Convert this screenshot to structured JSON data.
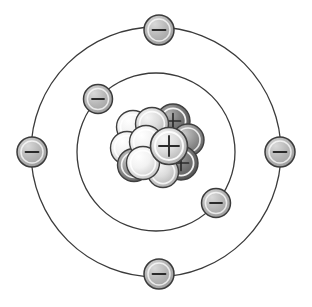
{
  "diagram": {
    "type": "atomic-structure",
    "background_color": "#ffffff",
    "center": {
      "x": 156,
      "y": 151
    },
    "line_color": "#3b3b3b",
    "nucleus": {
      "label": "nucleus",
      "proton_symbol": "+",
      "proton_count": 5,
      "neutron_count": 6,
      "particle_count": 11,
      "proton_color": "#8d8d8d",
      "proton_dark_color": "#6e6e6e",
      "neutron_color": "#d8d8d8",
      "neutron_light_color": "#efefef",
      "outline_color": "#3b3b3b",
      "particles": [
        {
          "id": "p1",
          "kind": "proton",
          "symbol": "+",
          "cx": 172,
          "cy": 122,
          "r": 16,
          "fill": "#767676",
          "z": 1
        },
        {
          "id": "n1",
          "kind": "neutron",
          "symbol": "",
          "cx": 133,
          "cy": 128,
          "r": 16,
          "fill": "#ececec",
          "z": 2
        },
        {
          "id": "n2",
          "kind": "neutron",
          "symbol": "",
          "cx": 152,
          "cy": 126,
          "r": 16,
          "fill": "#d4d4d4",
          "z": 3
        },
        {
          "id": "n3",
          "kind": "neutron",
          "symbol": "",
          "cx": 127,
          "cy": 148,
          "r": 16,
          "fill": "#cfcfcf",
          "z": 4
        },
        {
          "id": "p2",
          "kind": "proton",
          "symbol": "+",
          "cx": 183,
          "cy": 146,
          "r": 16,
          "fill": "#8a8a8a",
          "z": 5
        },
        {
          "id": "n4",
          "kind": "neutron",
          "symbol": "",
          "cx": 147,
          "cy": 168,
          "r": 16,
          "fill": "#bdbdbd",
          "z": 6
        },
        {
          "id": "p3",
          "kind": "proton",
          "symbol": "+",
          "cx": 131,
          "cy": 160,
          "r": 16,
          "fill": "#9b9b9b",
          "z": 7
        },
        {
          "id": "n5",
          "kind": "neutron",
          "symbol": "",
          "cx": 150,
          "cy": 147,
          "r": 17,
          "fill": "#e8e8e8",
          "z": 8
        },
        {
          "id": "p4",
          "kind": "proton",
          "symbol": "+",
          "cx": 178,
          "cy": 163,
          "r": 16,
          "fill": "#6f6f6f",
          "z": 9
        },
        {
          "id": "n6",
          "kind": "neutron",
          "symbol": "",
          "cx": 163,
          "cy": 170,
          "r": 15,
          "fill": "#c8c8c8",
          "z": 10
        },
        {
          "id": "p5",
          "kind": "proton",
          "symbol": "+",
          "cx": 166,
          "cy": 146,
          "r": 18,
          "fill": "#d0d0d0",
          "z": 11
        }
      ]
    },
    "orbits": [
      {
        "name": "inner-orbit",
        "shell_number": 1,
        "radius": 79,
        "electron_count": 2,
        "stroke": "#3b3b3b",
        "stroke_width": 1.2,
        "electrons": [
          {
            "id": "e-inner-1",
            "label": "electron",
            "symbol": "−",
            "angle_deg": 139,
            "cx": 96,
            "cy": 99,
            "r": 14
          },
          {
            "id": "e-inner-2",
            "label": "electron",
            "symbol": "−",
            "angle_deg": -36,
            "cx": 220,
            "cy": 203,
            "r": 14
          }
        ]
      },
      {
        "name": "outer-orbit",
        "shell_number": 2,
        "radius": 134,
        "electron_count": 4,
        "stroke": "#3b3b3b",
        "stroke_width": 1.2,
        "electrons": [
          {
            "id": "e-outer-top",
            "label": "electron",
            "symbol": "−",
            "angle_deg": 90,
            "cx": 159,
            "cy": 31,
            "r": 15
          },
          {
            "id": "e-outer-left",
            "label": "electron",
            "symbol": "−",
            "angle_deg": 180,
            "cx": 32,
            "cy": 152,
            "r": 15
          },
          {
            "id": "e-outer-right",
            "label": "electron",
            "symbol": "−",
            "angle_deg": 0,
            "cx": 281,
            "cy": 152,
            "r": 15
          },
          {
            "id": "e-outer-bottom",
            "label": "electron",
            "symbol": "−",
            "angle_deg": -90,
            "cx": 159,
            "cy": 276,
            "r": 15
          }
        ]
      }
    ],
    "electron_style": {
      "fill": "#b0b0b0",
      "fill_light": "#cfcfcf",
      "outline_color": "#3b3b3b",
      "symbol_color": "#2a2a2a",
      "ring_color": "#ffffff"
    }
  }
}
